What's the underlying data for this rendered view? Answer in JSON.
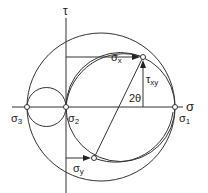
{
  "diagram": {
    "axes": {
      "horizontal": "σ",
      "vertical": "τ"
    },
    "labels": {
      "sigma1": "σ",
      "sigma1_sub": "1",
      "sigma2": "σ",
      "sigma2_sub": "2",
      "sigma3": "σ",
      "sigma3_sub": "3",
      "sigma_x": "σ",
      "sigma_x_sub": "x",
      "sigma_y": "σ",
      "sigma_y_sub": "y",
      "tau_xy": "τ",
      "tau_xy_sub": "xy",
      "angle": "2θ"
    },
    "colors": {
      "line": "#333333",
      "background": "#ffffff"
    }
  }
}
